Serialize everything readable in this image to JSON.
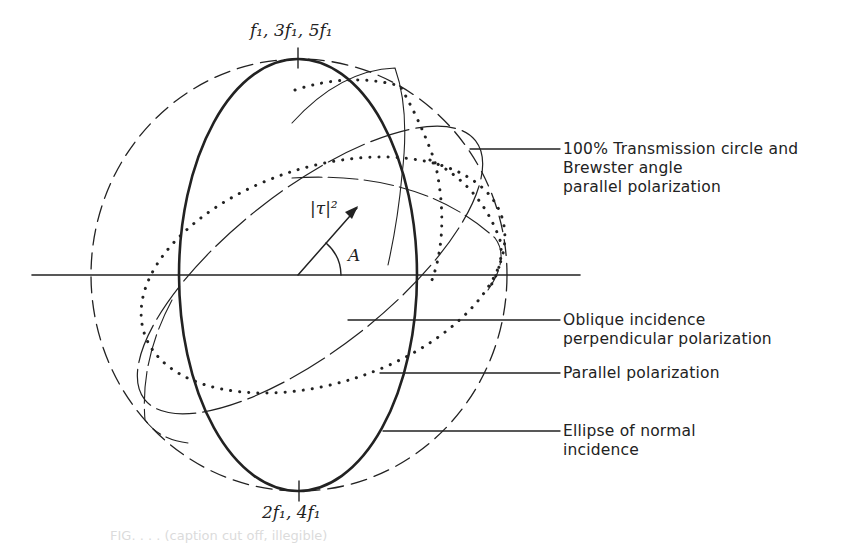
{
  "figure": {
    "type": "polarization-reflection diagram",
    "top_label": "f₁, 3f₁, 5f₁",
    "bottom_label": "2f₁, 4f₁",
    "vector_label": "|τ|²",
    "angle_label": "A",
    "callouts": [
      {
        "id": "transmission",
        "lines": [
          "100% Transmission circle and",
          "Brewster angle",
          "parallel polarization"
        ]
      },
      {
        "id": "oblique",
        "lines": [
          "Oblique incidence",
          "perpendicular polarization"
        ]
      },
      {
        "id": "parallel",
        "lines": [
          "Parallel polarization"
        ]
      },
      {
        "id": "normal",
        "lines": [
          "Ellipse of normal",
          "incidence"
        ]
      }
    ],
    "caption": "FIG. . . . (caption cut off, illegible)",
    "colors": {
      "ink": "#222222",
      "background": "#ffffff"
    }
  }
}
